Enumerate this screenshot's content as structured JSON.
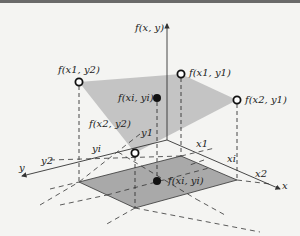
{
  "diagram": {
    "type": "3d-bilinear-interpolation",
    "axes": {
      "z_label": "f(x, y)",
      "x_label": "x",
      "y_label": "y"
    },
    "axis_ticks": {
      "x": [
        "x1",
        "xi",
        "x2"
      ],
      "y": [
        "y1",
        "yi",
        "y2"
      ]
    },
    "points": {
      "f_x1_y2": "f(x1, y2)",
      "f_x1_y1": "f(x1, y1)",
      "f_x2_y1": "f(x2, y1)",
      "f_x2_y2": "f(x2, y2)",
      "f_xi_yi_upper": "f(xi, yi)",
      "f_xi_yi_lower": "f(xi, yi)"
    },
    "colors": {
      "upper_plane": "#c4c4c4",
      "lower_rect": "#a9a9a9",
      "lines": "#333333",
      "background": "#f4f4f2"
    }
  }
}
